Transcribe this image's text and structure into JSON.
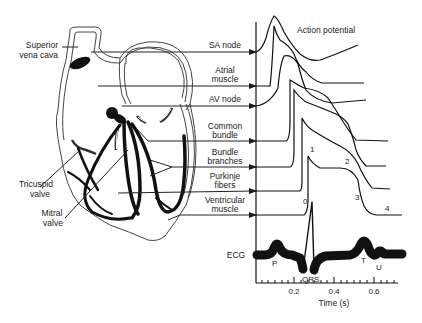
{
  "title": "Action potential",
  "heart_labels": {
    "superior_vena_cava": [
      "Superior",
      "vena cava"
    ],
    "tricuspid_valve": [
      "Tricuspid",
      "valve"
    ],
    "mitral_valve": [
      "Mitral",
      "valve"
    ]
  },
  "tissues": [
    {
      "id": "sa-node",
      "lines": [
        "SA node"
      ]
    },
    {
      "id": "atrial-muscle",
      "lines": [
        "Atrial",
        "muscle"
      ]
    },
    {
      "id": "av-node",
      "lines": [
        "AV node"
      ]
    },
    {
      "id": "common-bundle",
      "lines": [
        "Common",
        "bundle"
      ]
    },
    {
      "id": "bundle-branches",
      "lines": [
        "Bundle",
        "branches"
      ]
    },
    {
      "id": "purkinje-fibers",
      "lines": [
        "Purkinje",
        "fibers"
      ]
    },
    {
      "id": "ventricular-muscle",
      "lines": [
        "Ventricular",
        "muscle"
      ]
    }
  ],
  "phase_labels": [
    "0",
    "1",
    "2",
    "3",
    "4"
  ],
  "ecg": {
    "label": "ECG",
    "waves": [
      "P",
      "QRS",
      "T",
      "U"
    ]
  },
  "axis": {
    "xlabel": "Time (s)",
    "tick_labels": [
      "0.2",
      "0.4",
      "0.6"
    ]
  },
  "colors": {
    "ink": "#1a1a1a",
    "background": "#ffffff",
    "outline": "#555555"
  }
}
